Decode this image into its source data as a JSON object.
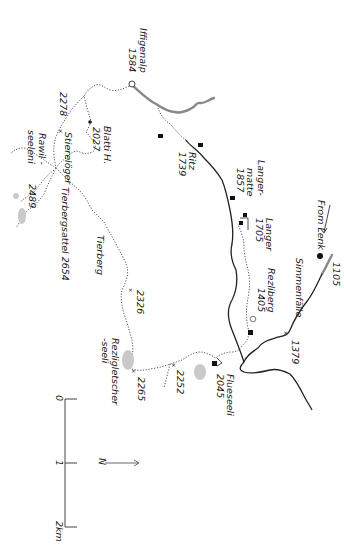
{
  "map": {
    "orientation": "rotated 90 degrees (north points right)",
    "labels": {
      "iffigenalp": "Iffigenalp",
      "iffigenalp_elev": "1584",
      "blatti": "Blatti H.",
      "blatti_elev": "2027",
      "p2278": "2278",
      "stierelager": "Stierelöger",
      "rawil": "Rawil -",
      "rawil2": "seeleni",
      "p2489": "2489",
      "tierbergsattel": "Tierbergsattel 2654",
      "tierberg": "Tierberg",
      "p2326": "2326",
      "ritz": "Ritz",
      "ritz_elev": "1739",
      "langermatte1": "Langer-",
      "langermatte2": "matte",
      "langermatte_elev": "1857",
      "langer1705_1": "Langer",
      "langer1705_elev": "1705",
      "from_lenk": "From Lenk",
      "p1105": "1105",
      "simmenfalle": "Simmenfälle",
      "rezliberg": "Rezliberg",
      "rezliberg_elev": "1405",
      "p1379": "1379",
      "rezligletscher1": "Rezligletscher",
      "rezligletscher2": "-seeli",
      "p2265": "2265",
      "p2252": "2252",
      "fluesseeli": "Flueseeli",
      "fluesseeli_elev": "2045"
    },
    "scale": {
      "ticks": [
        "0",
        "1",
        "2km"
      ]
    },
    "north_label": "N"
  }
}
